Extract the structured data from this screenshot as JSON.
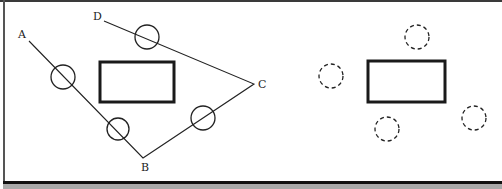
{
  "diagram": {
    "left_panel": {
      "path_points": {
        "A": {
          "label": "A",
          "x": 29,
          "y": 41,
          "label_x": 18,
          "label_y": 38
        },
        "B": {
          "label": "B",
          "x": 143,
          "y": 158,
          "label_x": 141,
          "label_y": 171
        },
        "C": {
          "label": "C",
          "x": 254,
          "y": 84,
          "label_x": 258,
          "label_y": 88
        },
        "D": {
          "label": "D",
          "x": 104,
          "y": 21,
          "label_x": 93,
          "label_y": 20
        }
      },
      "path_order": [
        "A",
        "B",
        "C",
        "D"
      ],
      "rectangle": {
        "x": 100,
        "y": 62,
        "width": 74,
        "height": 40
      },
      "circles": [
        {
          "cx": 63,
          "cy": 77,
          "r": 12
        },
        {
          "cx": 118,
          "cy": 129,
          "r": 11
        },
        {
          "cx": 147,
          "cy": 37,
          "r": 12
        },
        {
          "cx": 203,
          "cy": 118,
          "r": 12
        }
      ]
    },
    "right_panel": {
      "rectangle": {
        "x": 368,
        "y": 61,
        "width": 77,
        "height": 41
      },
      "dashed_circles": [
        {
          "cx": 417,
          "cy": 37,
          "r": 12
        },
        {
          "cx": 331,
          "cy": 76,
          "r": 12
        },
        {
          "cx": 387,
          "cy": 129,
          "r": 12
        },
        {
          "cx": 474,
          "cy": 118,
          "r": 12
        }
      ]
    },
    "colors": {
      "stroke": "#222222",
      "background": "#ffffff",
      "footer": "#a9a9a9"
    }
  }
}
